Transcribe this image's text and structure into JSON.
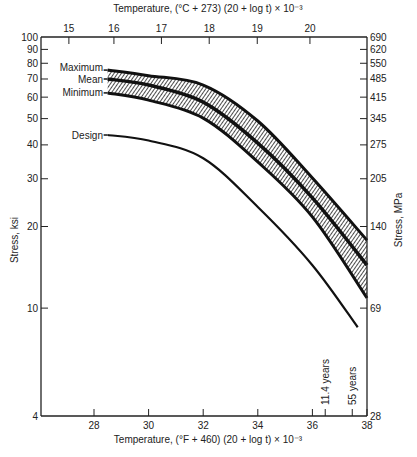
{
  "chart_data": {
    "type": "line",
    "title": "",
    "xlabel": "Temperature, (°F + 460) (20 + log t) × 10⁻³",
    "x2label": "Temperature, (°C + 273) (20 + log t) × 10⁻³",
    "ylabel": "Stress, ksi",
    "y2label": "Stress, MPa",
    "xlim": [
      26.9,
      38
    ],
    "ylim": [
      4,
      100
    ],
    "yscale": "log",
    "grid": false,
    "x_ticks": [
      28,
      30,
      32,
      34,
      36,
      38
    ],
    "x_minor_ticks": [
      36.47,
      37.46
    ],
    "y_ticks": [
      4,
      10,
      20,
      30,
      40,
      50,
      60,
      70,
      80,
      90,
      100
    ],
    "x2_ticks": [
      {
        "label": "15",
        "x": 27.08
      },
      {
        "label": "16",
        "x": 28.73
      },
      {
        "label": "17",
        "x": 30.47
      },
      {
        "label": "18",
        "x": 32.22
      },
      {
        "label": "19",
        "x": 33.98
      },
      {
        "label": "20",
        "x": 35.91
      }
    ],
    "y2_ticks": [
      {
        "label": "690",
        "y": 100
      },
      {
        "label": "620",
        "y": 90
      },
      {
        "label": "550",
        "y": 80
      },
      {
        "label": "485",
        "y": 70
      },
      {
        "label": "415",
        "y": 60
      },
      {
        "label": "345",
        "y": 50
      },
      {
        "label": "275",
        "y": 40
      },
      {
        "label": "205",
        "y": 30
      },
      {
        "label": "140",
        "y": 20
      },
      {
        "label": "69",
        "y": 10
      },
      {
        "label": "28",
        "y": 4
      }
    ],
    "series": [
      {
        "name": "Maximum",
        "x": [
          28.5,
          30,
          32,
          34,
          36,
          38
        ],
        "y": [
          75.5,
          72,
          66.5,
          49,
          30.2,
          17.8
        ]
      },
      {
        "name": "Mean",
        "x": [
          28.5,
          30,
          32,
          34,
          36,
          38
        ],
        "y": [
          70,
          66.5,
          57.5,
          40.6,
          25.5,
          14.4
        ]
      },
      {
        "name": "Minimum",
        "x": [
          28.5,
          30,
          32,
          34,
          36,
          38
        ],
        "y": [
          62.2,
          58.5,
          50.2,
          34.6,
          21.7,
          10.9
        ]
      },
      {
        "name": "Design",
        "x": [
          28.5,
          30,
          32,
          34,
          36,
          37.66
        ],
        "y": [
          43.5,
          41.5,
          35.7,
          23.6,
          14.4,
          8.5
        ]
      }
    ],
    "scatter_band": {
      "upper": "Maximum",
      "lower": "Minimum",
      "fill": "hatched"
    },
    "annotations": [
      {
        "text": "11.4 years",
        "x": 36.47
      },
      {
        "text": "55 years",
        "x": 37.46
      }
    ]
  }
}
